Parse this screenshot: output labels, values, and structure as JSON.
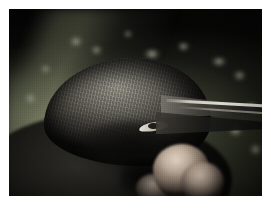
{
  "image": {
    "domain": "Natural-Image",
    "subject": "bird-head-in-hand",
    "description": "Close-up colour photograph of a small dark bird's head with a long pointed bill, held in a human hand",
    "caption": "",
    "width_px": 271,
    "height_px": 216,
    "border": {
      "color": "#ffffff",
      "left_px": 9,
      "top_px": 9,
      "right_px": 9,
      "bottom_px": 20
    },
    "photo": {
      "left_px": 9,
      "top_px": 9,
      "width_px": 253,
      "height_px": 187
    }
  },
  "palette": {
    "background_dark": "#060606",
    "background_vegetation": "#6e7258",
    "vegetation_highlight": "#9aa078",
    "bird_plumage_light": "#9a978d",
    "bird_plumage_mid": "#6b6962",
    "bird_plumage_dark": "#1a1916",
    "bill_dark": "#151513",
    "bill_highlight": "#e8e6dc",
    "eye_highlight": "#ece9df",
    "skin_highlight": "#ecdece",
    "skin_mid": "#b49880",
    "shadow": "#000000",
    "frame": "#ffffff"
  },
  "elements": {
    "background_label": "Dark out-of-focus background",
    "vegetation_label": "Blurred green vegetation",
    "specular_label": "Blurred background highlight",
    "bird_body_label": "Bird body in shadow",
    "bird_head_label": "Bird head with streaked plumage",
    "head_texture_label": "Feather texture streaks",
    "cheek_label": "Dark ear coverts",
    "eye_label": "Bird eye",
    "pupil_label": "Pupil",
    "bill_upper_label": "Upper mandible",
    "bill_lower_label": "Lower mandible",
    "bill_highlight_label": "Bill specular highlight",
    "finger_main_label": "Index finger",
    "finger_second_label": "Second finger",
    "finger_third_label": "Thumb tip",
    "hand_shadow_label": "Shadow between fingers",
    "grain_label": "Film grain",
    "vignette_label": "Lens vignette"
  },
  "specular_highlights": [
    {
      "x_pct": 23,
      "y_pct": 15,
      "w_pct": 7,
      "h_pct": 5
    },
    {
      "x_pct": 32,
      "y_pct": 20,
      "w_pct": 5,
      "h_pct": 4
    },
    {
      "x_pct": 45,
      "y_pct": 12,
      "w_pct": 4,
      "h_pct": 3
    },
    {
      "x_pct": 52,
      "y_pct": 22,
      "w_pct": 9,
      "h_pct": 4
    },
    {
      "x_pct": 66,
      "y_pct": 18,
      "w_pct": 6,
      "h_pct": 4
    },
    {
      "x_pct": 79,
      "y_pct": 26,
      "w_pct": 8,
      "h_pct": 4
    },
    {
      "x_pct": 88,
      "y_pct": 33,
      "w_pct": 6,
      "h_pct": 5
    },
    {
      "x_pct": 12,
      "y_pct": 30,
      "w_pct": 5,
      "h_pct": 4
    },
    {
      "x_pct": 5,
      "y_pct": 45,
      "w_pct": 7,
      "h_pct": 6
    },
    {
      "x_pct": 93,
      "y_pct": 50,
      "w_pct": 6,
      "h_pct": 5
    },
    {
      "x_pct": 86,
      "y_pct": 62,
      "w_pct": 7,
      "h_pct": 6
    },
    {
      "x_pct": 95,
      "y_pct": 72,
      "w_pct": 5,
      "h_pct": 6
    }
  ]
}
